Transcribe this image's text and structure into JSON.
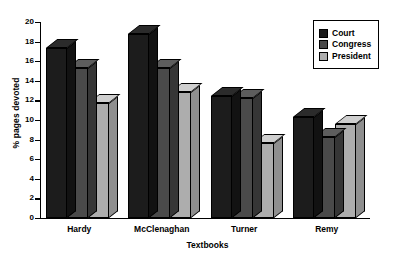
{
  "chart_data": {
    "type": "bar",
    "title": "",
    "xlabel": "Textbooks",
    "ylabel": "% pages devoted",
    "categories": [
      "Hardy",
      "McClenaghan",
      "Turner",
      "Remy"
    ],
    "series": [
      {
        "name": "Court",
        "color": "#1c1c1c",
        "values": [
          17.3,
          18.8,
          12.4,
          10.3
        ]
      },
      {
        "name": "Congress",
        "color": "#4a4a4a",
        "values": [
          15.3,
          15.3,
          12.2,
          8.3
        ]
      },
      {
        "name": "President",
        "color": "#adadad",
        "values": [
          11.7,
          12.9,
          7.7,
          9.6
        ]
      }
    ],
    "ylim": [
      0,
      20
    ],
    "yticks": [
      0,
      2,
      4,
      6,
      8,
      10,
      12,
      14,
      16,
      18,
      20
    ],
    "ytick_labels": [
      "0",
      "2",
      "4",
      "6",
      "8",
      "10",
      "12",
      "14",
      "16",
      "18",
      "20"
    ],
    "grid": false,
    "legend_position": "top-right",
    "style": "3d-bar"
  },
  "legend": {
    "items": [
      {
        "label": "Court"
      },
      {
        "label": "Congress"
      },
      {
        "label": "President"
      }
    ]
  }
}
